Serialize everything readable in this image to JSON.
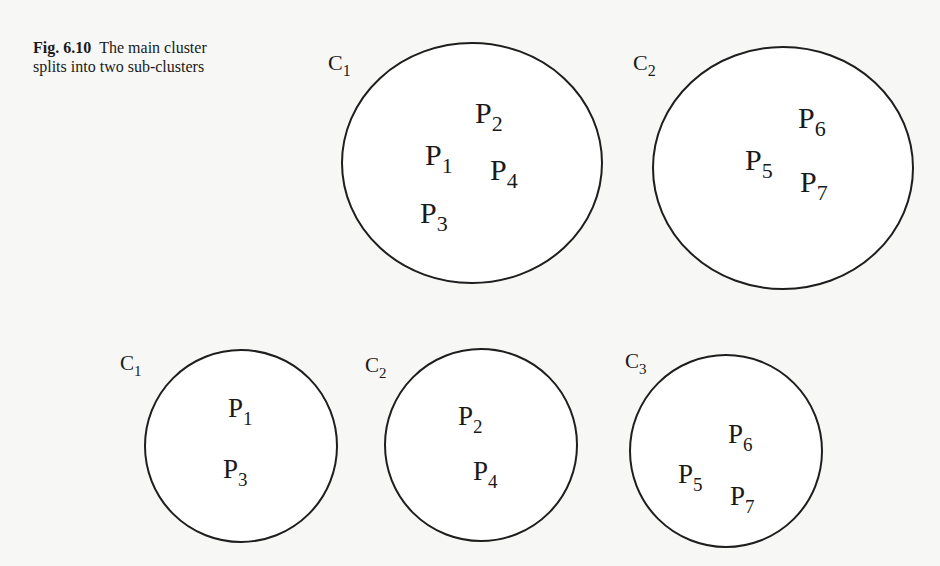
{
  "caption": {
    "figure_number": "Fig. 6.10",
    "line1": "The main cluster",
    "line2": "splits into two sub-clusters"
  },
  "colors": {
    "background": "#f7f7f5",
    "circle_fill": "#ffffff",
    "stroke": "#1e1e1e",
    "text": "#1a1a1a"
  },
  "top_row": {
    "description": "Main cluster state: two clusters",
    "font_size": 30,
    "label_font_size": 22,
    "clusters": [
      {
        "name": "C",
        "sub": "1",
        "cx": 472,
        "cy": 163,
        "rx": 130,
        "ry": 120,
        "label_x": 328,
        "label_y": 70,
        "points": [
          {
            "name": "P",
            "sub": "2",
            "x": 475,
            "y": 123
          },
          {
            "name": "P",
            "sub": "1",
            "x": 425,
            "y": 165
          },
          {
            "name": "P",
            "sub": "4",
            "x": 490,
            "y": 180
          },
          {
            "name": "P",
            "sub": "3",
            "x": 420,
            "y": 223
          }
        ]
      },
      {
        "name": "C",
        "sub": "2",
        "cx": 783,
        "cy": 168,
        "rx": 130,
        "ry": 121,
        "label_x": 633,
        "label_y": 70,
        "points": [
          {
            "name": "P",
            "sub": "6",
            "x": 798,
            "y": 128
          },
          {
            "name": "P",
            "sub": "5",
            "x": 745,
            "y": 170
          },
          {
            "name": "P",
            "sub": "7",
            "x": 800,
            "y": 192
          }
        ]
      }
    ]
  },
  "bottom_row": {
    "description": "After split: three clusters",
    "font_size": 27,
    "label_font_size": 21,
    "clusters": [
      {
        "name": "C",
        "sub": "1",
        "cx": 241,
        "cy": 446,
        "rx": 96,
        "ry": 96,
        "label_x": 120,
        "label_y": 370,
        "points": [
          {
            "name": "P",
            "sub": "1",
            "x": 228,
            "y": 417
          },
          {
            "name": "P",
            "sub": "3",
            "x": 223,
            "y": 478
          }
        ]
      },
      {
        "name": "C",
        "sub": "2",
        "cx": 481,
        "cy": 445,
        "rx": 96,
        "ry": 96,
        "label_x": 365,
        "label_y": 372,
        "points": [
          {
            "name": "P",
            "sub": "2",
            "x": 458,
            "y": 425
          },
          {
            "name": "P",
            "sub": "4",
            "x": 473,
            "y": 480
          }
        ]
      },
      {
        "name": "C",
        "sub": "3",
        "cx": 726,
        "cy": 451,
        "rx": 96,
        "ry": 96,
        "label_x": 625,
        "label_y": 368,
        "points": [
          {
            "name": "P",
            "sub": "6",
            "x": 728,
            "y": 443
          },
          {
            "name": "P",
            "sub": "5",
            "x": 678,
            "y": 483
          },
          {
            "name": "P",
            "sub": "7",
            "x": 730,
            "y": 505
          }
        ]
      }
    ]
  }
}
